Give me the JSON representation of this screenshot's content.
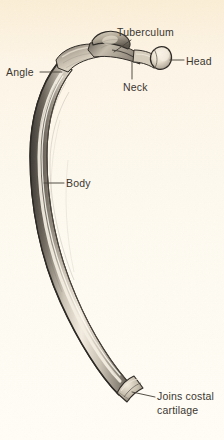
{
  "figure": {
    "background_color": "#fdf4e3",
    "ink_color": "#3b3630",
    "leader_line_color": "#4a443c"
  },
  "labels": [
    {
      "id": "tuberculum",
      "text": "Tuberculum",
      "x": 117,
      "y": 26
    },
    {
      "id": "head",
      "text": "Head",
      "x": 186,
      "y": 55
    },
    {
      "id": "angle",
      "text": "Angle",
      "x": 6,
      "y": 66
    },
    {
      "id": "neck",
      "text": "Neck",
      "x": 123,
      "y": 81
    },
    {
      "id": "body",
      "text": "Body",
      "x": 66,
      "y": 177
    },
    {
      "id": "joins-costal-cartilage",
      "line1": "Joins costal",
      "line2": "cartilage",
      "x": 157,
      "y": 390
    }
  ]
}
